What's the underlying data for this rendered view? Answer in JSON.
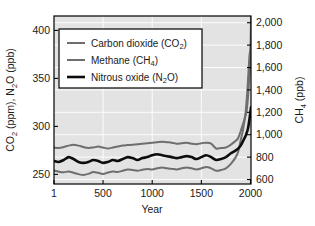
{
  "chart_data": {
    "type": "line",
    "title": "",
    "xlabel": "Year",
    "ylabel_left": "CO2 (ppm), N2O (ppb)",
    "ylabel_right": "CH4 (ppb)",
    "xlim": [
      1,
      2005
    ],
    "ylim_left": [
      240,
      415
    ],
    "ylim_right": [
      560,
      2060
    ],
    "grid": true,
    "legend_position": "upper-left-inside",
    "plot_background": "#e3e3e3",
    "gridline_color": "#ffffff",
    "frame_color": "#000000",
    "xticks": [
      1,
      500,
      1000,
      1500,
      2000
    ],
    "xtick_labels": [
      "1",
      "500",
      "1000",
      "1500",
      "2000"
    ],
    "yticks_left": [
      250,
      300,
      350,
      400
    ],
    "ytick_labels_left": [
      "250",
      "300",
      "350",
      "400"
    ],
    "yticks_right": [
      600,
      800,
      1000,
      1200,
      1400,
      1600,
      1800,
      2000
    ],
    "ytick_labels_right": [
      "600",
      "800",
      "1,000",
      "1,200",
      "1,400",
      "1,600",
      "1,800",
      "2,000"
    ],
    "series": [
      {
        "name": "Carbon dioxide (CO2)",
        "label_html": "Carbon dioxide (CO<sub>2</sub>)",
        "axis": "left",
        "color": "#6e6e6e",
        "width": 2.0,
        "unit": "ppm",
        "x": [
          1,
          50,
          100,
          150,
          200,
          250,
          300,
          350,
          400,
          450,
          500,
          550,
          600,
          650,
          700,
          750,
          800,
          850,
          900,
          950,
          1000,
          1050,
          1100,
          1150,
          1200,
          1250,
          1300,
          1350,
          1400,
          1450,
          1500,
          1550,
          1600,
          1650,
          1700,
          1750,
          1800,
          1850,
          1875,
          1900,
          1925,
          1950,
          1960,
          1970,
          1980,
          1990,
          2000,
          2005
        ],
        "values": [
          278,
          277.5,
          278.5,
          280,
          281,
          280,
          278.5,
          277.5,
          278,
          279,
          278,
          277,
          278,
          279,
          280,
          280.5,
          281,
          281.5,
          282,
          282.5,
          283,
          283.5,
          284,
          283.5,
          283,
          282,
          282.5,
          283,
          282,
          281.5,
          282.5,
          283,
          282,
          277,
          277.5,
          278,
          281,
          285,
          288,
          295,
          303,
          311,
          316,
          325,
          338,
          354,
          369,
          378
        ]
      },
      {
        "name": "Methane (CH4)",
        "label_html": "Methane (CH<sub>4</sub>)",
        "axis": "right",
        "color": "#6e6e6e",
        "width": 2.0,
        "unit": "ppb",
        "x": [
          1,
          50,
          100,
          150,
          200,
          250,
          300,
          350,
          400,
          450,
          500,
          550,
          600,
          650,
          700,
          750,
          800,
          850,
          900,
          950,
          1000,
          1050,
          1100,
          1150,
          1200,
          1250,
          1300,
          1350,
          1400,
          1450,
          1500,
          1550,
          1600,
          1650,
          1700,
          1750,
          1800,
          1850,
          1875,
          1900,
          1925,
          1950,
          1960,
          1970,
          1980,
          1990,
          2000,
          2005
        ],
        "values": [
          680,
          670,
          665,
          672,
          660,
          648,
          640,
          650,
          668,
          660,
          650,
          662,
          672,
          668,
          678,
          690,
          685,
          678,
          688,
          695,
          690,
          700,
          708,
          700,
          695,
          690,
          700,
          708,
          700,
          690,
          700,
          712,
          700,
          678,
          685,
          700,
          740,
          800,
          850,
          950,
          1050,
          1200,
          1300,
          1420,
          1570,
          1710,
          1790,
          2050
        ]
      },
      {
        "name": "Nitrous oxide (N2O)",
        "label_html": "Nitrous oxide (N<sub>2</sub>O)",
        "axis": "left",
        "color": "#0d0d0d",
        "width": 2.6,
        "unit": "ppb",
        "x": [
          1,
          50,
          100,
          150,
          200,
          250,
          300,
          350,
          400,
          450,
          500,
          550,
          600,
          650,
          700,
          750,
          800,
          850,
          900,
          950,
          1000,
          1050,
          1100,
          1150,
          1200,
          1250,
          1300,
          1350,
          1400,
          1450,
          1500,
          1550,
          1600,
          1650,
          1700,
          1750,
          1800,
          1850,
          1875,
          1900,
          1925,
          1950,
          1960,
          1970,
          1980,
          1990,
          2000,
          2005
        ],
        "values": [
          264,
          263,
          265,
          268,
          266,
          263,
          262,
          263,
          265,
          264,
          262,
          263,
          265,
          264,
          266,
          268,
          267,
          265,
          267,
          268,
          270,
          271,
          270,
          269,
          268,
          267,
          268,
          269,
          268,
          266,
          268,
          270,
          268,
          265,
          266,
          268,
          272,
          275,
          277,
          280,
          285,
          290,
          293,
          296,
          301,
          308,
          316,
          320
        ]
      }
    ]
  },
  "axes": {
    "left_title_parts": [
      "CO",
      "2",
      " (ppm), N",
      "2",
      "O (ppb)"
    ],
    "right_title_parts": [
      "CH",
      "4",
      " (ppb)"
    ],
    "x_title": "Year"
  },
  "legend": {
    "entries": [
      {
        "label": "Carbon dioxide (CO2)",
        "prefix": "Carbon dioxide (CO",
        "sub": "2",
        "suffix": ")",
        "color": "#6e6e6e",
        "width": 2.0
      },
      {
        "label": "Methane (CH4)",
        "prefix": "Methane (CH",
        "sub": "4",
        "suffix": ")",
        "color": "#6e6e6e",
        "width": 2.0
      },
      {
        "label": "Nitrous oxide (N2O)",
        "prefix": "Nitrous oxide (N",
        "sub": "2",
        "suffix": "O)",
        "color": "#0d0d0d",
        "width": 2.6
      }
    ]
  }
}
